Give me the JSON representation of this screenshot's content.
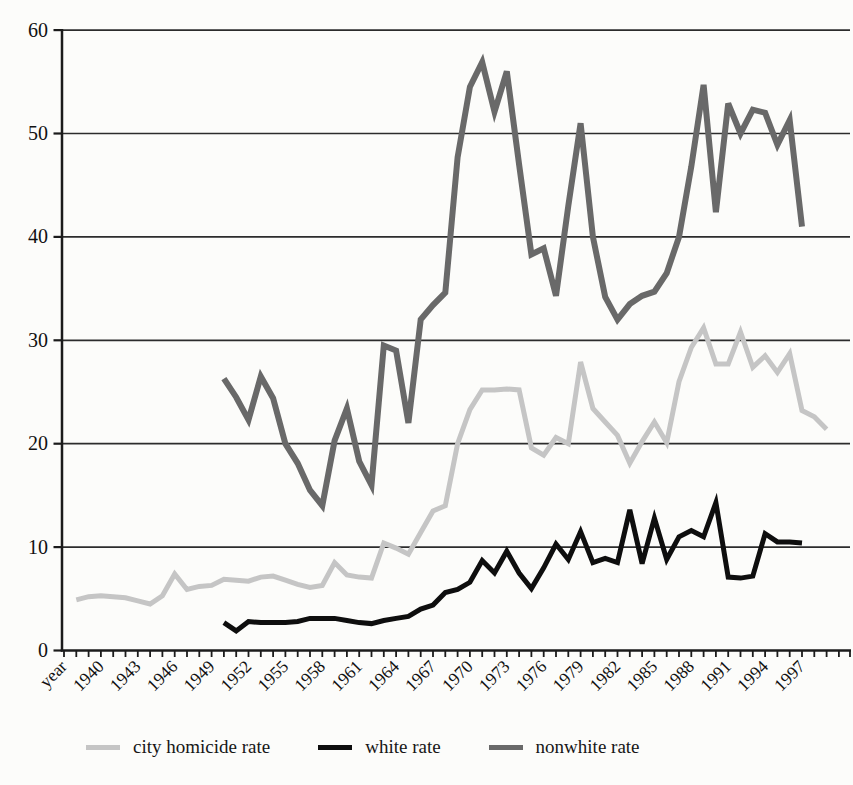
{
  "figure": {
    "background": "#fcfcfa"
  },
  "chart_data": {
    "type": "line",
    "title": "",
    "xlabel": "year",
    "ylabel": "",
    "ylim": [
      0,
      60
    ],
    "y_ticks": [
      0,
      10,
      20,
      30,
      40,
      50,
      60
    ],
    "grid": "horizontal",
    "legend_position": "bottom",
    "x_tick_labels": [
      "year",
      "1940",
      "1943",
      "1946",
      "1949",
      "1952",
      "1955",
      "1958",
      "1961",
      "1964",
      "1967",
      "1970",
      "1973",
      "1976",
      "1979",
      "1982",
      "1985",
      "1988",
      "1991",
      "1994",
      "1997"
    ],
    "x_label_step_years": 3,
    "categories_start": 1938,
    "categories_end": 1999,
    "style": {
      "grid_color": "#2c2c2c",
      "axis_color": "#1b1b1b",
      "text_color": "#111111"
    },
    "series": [
      {
        "name": "city homicide rate",
        "color": "#c5c5c5",
        "stroke_width": 5,
        "start_year": 1938,
        "values": [
          4.9,
          5.2,
          5.3,
          5.2,
          5.1,
          4.8,
          4.5,
          5.3,
          7.4,
          5.9,
          6.2,
          6.3,
          6.9,
          6.8,
          6.7,
          7.1,
          7.2,
          6.8,
          6.4,
          6.1,
          6.3,
          8.5,
          7.3,
          7.1,
          7.0,
          10.4,
          9.9,
          9.3,
          11.4,
          13.5,
          14.0,
          20.0,
          23.3,
          25.2,
          25.2,
          25.3,
          25.2,
          19.6,
          18.9,
          20.6,
          20.0,
          27.9,
          23.4,
          22.1,
          20.8,
          18.1,
          20.2,
          22.1,
          20.1,
          26.0,
          29.3,
          31.2,
          27.7,
          27.7,
          30.8,
          27.4,
          28.5,
          26.9,
          28.7,
          23.2,
          22.6,
          21.4
        ]
      },
      {
        "name": "white rate",
        "color": "#0e0e0e",
        "stroke_width": 5,
        "start_year": 1950,
        "values": [
          2.7,
          1.9,
          2.8,
          2.7,
          2.7,
          2.7,
          2.8,
          3.1,
          3.1,
          3.1,
          2.9,
          2.7,
          2.6,
          2.9,
          3.1,
          3.3,
          4.0,
          4.4,
          5.6,
          5.9,
          6.6,
          8.7,
          7.5,
          9.6,
          7.5,
          6.0,
          8.0,
          10.3,
          8.8,
          11.5,
          8.5,
          8.9,
          8.5,
          13.6,
          8.4,
          12.8,
          8.8,
          11.0,
          11.6,
          11.0,
          14.3,
          7.1,
          7.0,
          7.2,
          11.3,
          10.5,
          10.5,
          10.4
        ]
      },
      {
        "name": "nonwhite rate",
        "color": "#696969",
        "stroke_width": 6,
        "start_year": 1950,
        "values": [
          26.3,
          24.5,
          22.3,
          26.5,
          24.4,
          20.0,
          18.1,
          15.5,
          14.0,
          20.3,
          23.4,
          18.3,
          16.0,
          29.5,
          29.0,
          22.0,
          32.0,
          33.4,
          34.6,
          47.7,
          54.5,
          56.9,
          52.1,
          56.0,
          47.0,
          38.3,
          38.9,
          34.3,
          43.0,
          51.0,
          40.0,
          34.2,
          32.0,
          33.5,
          34.3,
          34.7,
          36.5,
          40.0,
          46.8,
          54.7,
          42.4,
          52.9,
          50.0,
          52.3,
          52.0,
          48.9,
          51.3,
          41.0
        ]
      }
    ]
  },
  "legend": {
    "items": [
      {
        "label": "city homicide rate"
      },
      {
        "label": "white rate"
      },
      {
        "label": "nonwhite rate"
      }
    ]
  }
}
